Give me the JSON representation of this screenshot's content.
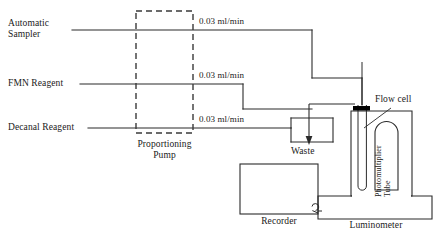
{
  "diagram": {
    "colors": {
      "line": "#2b2b2b",
      "dashed": "#3a3a3a",
      "text": "#1a1a1a",
      "background": "#ffffff",
      "stopper": "#000000"
    },
    "inputs": [
      {
        "id": "automatic-sampler",
        "label_line1": "Automatic",
        "label_line2": "Sampler",
        "flow_rate": "0.03 ml/min"
      },
      {
        "id": "fmn-reagent",
        "label_line1": "FMN Reagent",
        "label_line2": "",
        "flow_rate": "0.03 ml/min"
      },
      {
        "id": "decanal-reagent",
        "label_line1": "Decanal Reagent",
        "label_line2": "",
        "flow_rate": "0.03 ml/min"
      }
    ],
    "pump": {
      "label_line1": "Proportioning",
      "label_line2": "Pump"
    },
    "waste": {
      "label": "Waste"
    },
    "flow_cell": {
      "label": "Flow cell"
    },
    "photomultiplier": {
      "label_line1": "Photomultiplier",
      "label_line2": "Tube"
    },
    "luminometer": {
      "label": "Luminometer"
    },
    "recorder": {
      "label": "Recorder"
    }
  }
}
